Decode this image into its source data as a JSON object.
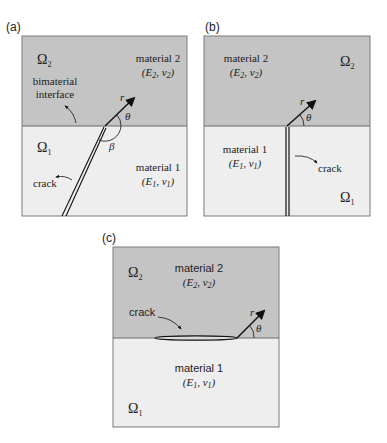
{
  "colors": {
    "material2_fill": "#c4c4c4",
    "material1_fill": "#eeeeee",
    "border": "#7a7a7a",
    "ink": "#111111"
  },
  "panels": [
    {
      "id": "a",
      "label": "(a)",
      "omega2": "Ω",
      "omega2_sub": "2",
      "omega1": "Ω",
      "omega1_sub": "1",
      "material2_label": "material 2",
      "material2_props": "(E2, ν2)",
      "material1_label": "material 1",
      "material1_props": "(E1, ν1)",
      "interface_label_line1": "bimaterial",
      "interface_label_line2": "interface",
      "crack_label": "crack",
      "r_label": "r",
      "theta_label": "θ",
      "beta_label": "β"
    },
    {
      "id": "b",
      "label": "(b)",
      "omega2": "Ω",
      "omega2_sub": "2",
      "omega1": "Ω",
      "omega1_sub": "1",
      "material2_label": "material 2",
      "material2_props": "(E2, ν2)",
      "material1_label": "material 1",
      "material1_props": "(E1, ν1)",
      "crack_label": "crack",
      "r_label": "r",
      "theta_label": "θ"
    },
    {
      "id": "c",
      "label": "(c)",
      "omega2": "Ω",
      "omega2_sub": "2",
      "omega1": "Ω",
      "omega1_sub": "1",
      "material2_label": "material 2",
      "material2_props": "(E2, ν2)",
      "material1_label": "material 1",
      "material1_props": "(E1, ν1)",
      "crack_label": "crack",
      "r_label": "r",
      "theta_label": "θ"
    }
  ],
  "math": {
    "E": "E",
    "nu": "ν",
    "sub1": "1",
    "sub2": "2",
    "open": "(",
    "comma": ", ",
    "close": ")"
  }
}
